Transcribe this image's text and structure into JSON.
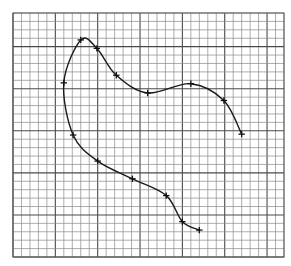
{
  "chart_data": {
    "type": "line",
    "title": "",
    "xlabel": "",
    "ylabel": "",
    "grid": true,
    "grid_cols": 32,
    "grid_rows": 29,
    "major_every": 5,
    "xlim": [
      0,
      32
    ],
    "ylim": [
      0,
      29
    ],
    "legend": null,
    "series": [
      {
        "name": "curve",
        "marker": "+",
        "color": "#1a1a1a",
        "points": [
          {
            "x": 22.0,
            "y": 3.2
          },
          {
            "x": 20.0,
            "y": 4.2
          },
          {
            "x": 18.1,
            "y": 7.3
          },
          {
            "x": 14.1,
            "y": 9.3
          },
          {
            "x": 10.0,
            "y": 11.4
          },
          {
            "x": 7.1,
            "y": 14.5
          },
          {
            "x": 6.0,
            "y": 20.7
          },
          {
            "x": 8.0,
            "y": 25.8
          },
          {
            "x": 9.9,
            "y": 24.8
          },
          {
            "x": 12.2,
            "y": 21.6
          },
          {
            "x": 15.9,
            "y": 19.5
          },
          {
            "x": 21.0,
            "y": 20.6
          },
          {
            "x": 24.9,
            "y": 18.6
          },
          {
            "x": 27.0,
            "y": 14.6
          }
        ]
      }
    ]
  },
  "colors": {
    "background": "#ffffff",
    "grid_minor": "#8a8a8a",
    "grid_major": "#4a4a4a",
    "curve": "#1a1a1a"
  }
}
